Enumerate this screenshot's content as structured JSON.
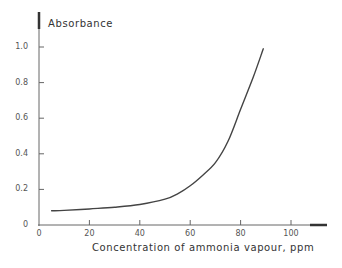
{
  "chart_data": {
    "type": "line",
    "title": "",
    "xlabel": "Concentration of ammonia vapour, ppm",
    "ylabel": "Absorbance",
    "xlim": [
      0,
      110
    ],
    "ylim": [
      0,
      1.05
    ],
    "x_ticks": [
      0,
      20,
      40,
      60,
      80,
      100
    ],
    "x_tick_labels": [
      "0",
      "20",
      "40",
      "60",
      "80",
      "100"
    ],
    "y_ticks": [
      0,
      0.2,
      0.4,
      0.6,
      0.8,
      1.0
    ],
    "y_tick_labels": [
      "0",
      "0.2",
      "0.4",
      "0.6",
      "0.8",
      "1.0"
    ],
    "grid": false,
    "legend": null,
    "series": [
      {
        "name": "Absorbance vs ammonia concentration",
        "x": [
          5,
          10,
          20,
          30,
          40,
          50,
          55,
          60,
          65,
          70,
          75,
          80,
          85,
          89
        ],
        "y": [
          0.08,
          0.082,
          0.09,
          0.1,
          0.115,
          0.145,
          0.175,
          0.22,
          0.28,
          0.35,
          0.47,
          0.65,
          0.83,
          0.99
        ]
      }
    ]
  },
  "style": {
    "axis_color": "#555555",
    "curve_color": "#444444"
  }
}
